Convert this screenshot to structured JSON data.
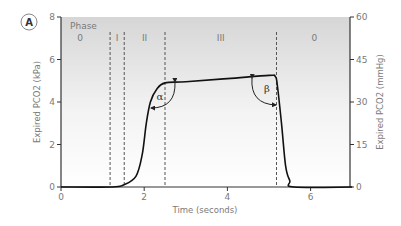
{
  "chart_data": {
    "type": "line",
    "panel_label": "A",
    "title": "",
    "xlabel": "Time (seconds)",
    "ylabel_left": "Expired PCO2 (kPa)",
    "ylabel_right": "Expired PCO2 (mmHg)",
    "xlim": [
      0,
      7
    ],
    "ylim_left": [
      0,
      8
    ],
    "ylim_right": [
      0,
      60
    ],
    "x_ticks": [
      "0",
      "2",
      "4",
      "6"
    ],
    "y_ticks_left": [
      "0",
      "2",
      "4",
      "6",
      "8"
    ],
    "y_ticks_right": [
      "0",
      "15",
      "30",
      "45",
      "60"
    ],
    "grid": false,
    "phase_header": "Phase",
    "phases": [
      {
        "label": "0",
        "x_start": 0,
        "x_end": 1.18
      },
      {
        "label": "I",
        "x_start": 1.18,
        "x_end": 1.52
      },
      {
        "label": "II",
        "x_start": 1.52,
        "x_end": 2.5
      },
      {
        "label": "III",
        "x_start": 2.5,
        "x_end": 5.18
      },
      {
        "label": "0",
        "x_start": 5.18,
        "x_end": 7
      }
    ],
    "phase_boundaries": [
      1.18,
      1.52,
      2.5,
      5.18
    ],
    "angle_labels": [
      "α",
      "β"
    ],
    "series": [
      {
        "name": "Expired PCO2",
        "x": [
          0,
          1.2,
          1.5,
          1.8,
          1.95,
          2.05,
          2.15,
          2.3,
          2.5,
          3.0,
          4.0,
          5.0,
          5.15,
          5.2,
          5.3,
          5.4,
          5.5,
          5.6,
          7.0
        ],
        "y": [
          0,
          0,
          0.1,
          0.5,
          1.5,
          3.0,
          4.0,
          4.6,
          4.9,
          4.95,
          5.1,
          5.25,
          5.2,
          4.8,
          3.0,
          1.0,
          0.3,
          0,
          0
        ]
      }
    ],
    "legend": null
  }
}
